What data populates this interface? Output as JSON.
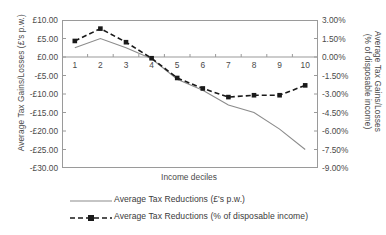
{
  "chart_data": {
    "type": "line",
    "title": "",
    "xlabel": "Income deciles",
    "categories": [
      "1",
      "2",
      "3",
      "4",
      "5",
      "6",
      "7",
      "8",
      "9",
      "10"
    ],
    "series": [
      {
        "name": "Average Tax Reductions (£'s p.w.)",
        "axis": "left",
        "style": "solid",
        "marker": "none",
        "color": "#8c8c8c",
        "values": [
          2.5,
          5.0,
          2.5,
          -0.5,
          -6.0,
          -9.0,
          -13.0,
          -15.0,
          -19.5,
          -25.0
        ]
      },
      {
        "name": "Average Tax Reductions (% of disposable income)",
        "axis": "right",
        "style": "dashed",
        "marker": "square",
        "color": "#1a1a1a",
        "values": [
          1.3,
          2.3,
          1.2,
          -0.1,
          -1.7,
          -2.55,
          -3.25,
          -3.1,
          -3.1,
          -2.3
        ]
      }
    ],
    "left_axis": {
      "label": "Average Tax Gains/Losses (£'s p.w.)",
      "ylim": [
        -30,
        10
      ],
      "tick_step": 5,
      "ticks": [
        "£10.00",
        "£5.00",
        "£0.00",
        "-£5.00",
        "-£10.00",
        "-£15.00",
        "-£20.00",
        "-£25.00",
        "-£30.00"
      ],
      "tick_values": [
        10,
        5,
        0,
        -5,
        -10,
        -15,
        -20,
        -25,
        -30
      ]
    },
    "right_axis": {
      "label_line1": "Average Tax Gains/Losses",
      "label_line2": "(% of disposable income)",
      "ylim": [
        -9,
        3
      ],
      "tick_step": 1.5,
      "ticks": [
        "3.00%",
        "1.50%",
        "0.00%",
        "-1.50%",
        "-3.00%",
        "-4.50%",
        "-6.00%",
        "-7.50%",
        "-9.00%"
      ],
      "tick_values": [
        3,
        1.5,
        0,
        -1.5,
        -3,
        -4.5,
        -6,
        -7.5,
        -9
      ]
    },
    "grid": false,
    "legend_position": "bottom",
    "legend": [
      "Average Tax Reductions (£'s p.w.)",
      "Average Tax Reductions (% of disposable income)"
    ]
  }
}
